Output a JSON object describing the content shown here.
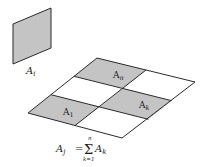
{
  "colors": {
    "shade": "#c4c4c4",
    "line": "#2a2a2a",
    "background": "#ffffff"
  },
  "element": {
    "label_main": "A",
    "label_sub": "i"
  },
  "grid": {
    "cells": [
      {
        "main": "A",
        "sub": "n"
      },
      {
        "main": "A",
        "sub": "k"
      },
      {
        "main": "A",
        "sub": "1"
      }
    ]
  },
  "formula": {
    "lhs_main": "A",
    "lhs_sub": "j",
    "equals": "=",
    "sum": "Σ",
    "upper": "n",
    "lower": "k=1",
    "rhs_main": "A",
    "rhs_sub": "k"
  }
}
